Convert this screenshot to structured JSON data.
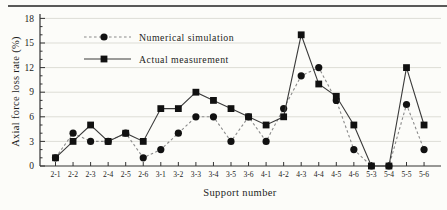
{
  "figure": {
    "background": "#fcfcf9",
    "border_top_color": "#3c3c3c"
  },
  "colors": {
    "axis": "#333333",
    "gridline": "#ddddd6",
    "text": "#1c1c1c",
    "simulation_line": "#8a8a8a",
    "measurement_line": "#3a3a3a",
    "marker": "#111111"
  },
  "chart_data": {
    "type": "line",
    "title": "",
    "xlabel": "Support number",
    "ylabel": "Axial force loss rate (%)",
    "ylim": [
      0,
      18
    ],
    "ytick_step": 3,
    "yticks": [
      0,
      3,
      6,
      9,
      12,
      15,
      18
    ],
    "grid": true,
    "legend_position": "top-left-inside",
    "categories": [
      "2-1",
      "2-2",
      "2-3",
      "2-4",
      "2-5",
      "2-6",
      "3-1",
      "3-2",
      "3-3",
      "3-4",
      "3-5",
      "3-6",
      "4-1",
      "4-2",
      "4-3",
      "4-4",
      "4-5",
      "4-6",
      "5-3",
      "5-4",
      "5-5",
      "5-6"
    ],
    "series": [
      {
        "name": "Numerical simulation",
        "marker": "circle",
        "line_style": "dashed",
        "values": [
          1,
          4,
          3,
          3,
          4,
          1,
          2,
          4,
          6,
          6,
          3,
          6,
          3,
          7,
          11,
          12,
          8,
          2,
          0,
          0,
          7.5,
          2
        ]
      },
      {
        "name": "Actual measurement",
        "marker": "square",
        "line_style": "solid",
        "values": [
          1,
          3,
          5,
          3,
          4,
          3,
          7,
          7,
          9,
          8,
          7,
          6,
          5,
          6,
          16,
          10,
          8.5,
          5,
          0,
          0,
          12,
          5
        ]
      }
    ]
  }
}
